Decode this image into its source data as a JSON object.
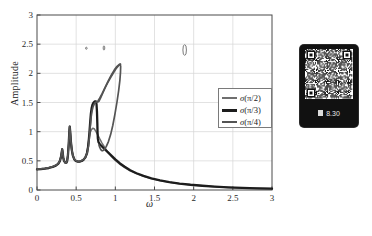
{
  "figure": {
    "ylabel": "Amplitude",
    "xlabel": "ω"
  },
  "legend": {
    "items": [
      {
        "label_sigma": "σ",
        "label_arg": "(π/2)",
        "color": "#6f6f6f",
        "width": 1.6
      },
      {
        "label_sigma": "σ",
        "label_arg": "(π/3)",
        "color": "#1d1d1d",
        "width": 2.4
      },
      {
        "label_sigma": "σ",
        "label_arg": "(π/4)",
        "color": "#545454",
        "width": 1.8
      }
    ]
  },
  "qr_panel": {
    "caption": "8.30"
  },
  "chart_data": {
    "type": "line",
    "title": "",
    "xlabel": "ω",
    "ylabel": "Amplitude",
    "xlim": [
      0,
      3
    ],
    "ylim": [
      0,
      3
    ],
    "xticks": [
      "0",
      "0.5",
      "1",
      "1.5",
      "2",
      "2.5",
      "3"
    ],
    "yticks": [
      "0",
      "0.5",
      "1",
      "1.5",
      "2",
      "2.5",
      "3"
    ],
    "xtick_values": [
      0,
      0.5,
      1,
      1.5,
      2,
      2.5,
      3
    ],
    "ytick_values": [
      0,
      0.5,
      1,
      1.5,
      2,
      2.5,
      3
    ],
    "grid": true,
    "legend_position": "right",
    "series": [
      {
        "name": "σ(π/2)",
        "color": "#6f6f6f",
        "width": 1.5,
        "points": [
          [
            0.0,
            0.355
          ],
          [
            0.05,
            0.36
          ],
          [
            0.1,
            0.368
          ],
          [
            0.15,
            0.38
          ],
          [
            0.2,
            0.398
          ],
          [
            0.24,
            0.42
          ],
          [
            0.27,
            0.45
          ],
          [
            0.29,
            0.495
          ],
          [
            0.305,
            0.56
          ],
          [
            0.315,
            0.64
          ],
          [
            0.322,
            0.7
          ],
          [
            0.328,
            0.64
          ],
          [
            0.335,
            0.56
          ],
          [
            0.345,
            0.5
          ],
          [
            0.36,
            0.47
          ],
          [
            0.375,
            0.47
          ],
          [
            0.385,
            0.5
          ],
          [
            0.395,
            0.6
          ],
          [
            0.405,
            0.79
          ],
          [
            0.412,
            0.98
          ],
          [
            0.418,
            1.09
          ],
          [
            0.424,
            1.0
          ],
          [
            0.432,
            0.84
          ],
          [
            0.444,
            0.69
          ],
          [
            0.458,
            0.59
          ],
          [
            0.475,
            0.53
          ],
          [
            0.495,
            0.5
          ],
          [
            0.52,
            0.49
          ],
          [
            0.545,
            0.49
          ],
          [
            0.57,
            0.5
          ],
          [
            0.595,
            0.52
          ],
          [
            0.615,
            0.555
          ],
          [
            0.632,
            0.61
          ],
          [
            0.645,
            0.7
          ],
          [
            0.655,
            0.8
          ],
          [
            0.665,
            0.9
          ],
          [
            0.678,
            0.98
          ],
          [
            0.695,
            1.035
          ],
          [
            0.712,
            1.058
          ],
          [
            0.73,
            1.05
          ],
          [
            0.75,
            1.01
          ],
          [
            0.772,
            0.955
          ],
          [
            0.8,
            0.88
          ],
          [
            0.83,
            0.805
          ],
          [
            0.865,
            0.73
          ],
          [
            0.905,
            0.65
          ],
          [
            0.95,
            0.575
          ],
          [
            1.0,
            0.505
          ],
          [
            1.06,
            0.44
          ],
          [
            1.12,
            0.385
          ],
          [
            1.19,
            0.33
          ],
          [
            1.27,
            0.28
          ],
          [
            1.36,
            0.236
          ],
          [
            1.46,
            0.196
          ],
          [
            1.57,
            0.162
          ],
          [
            1.69,
            0.133
          ],
          [
            1.82,
            0.108
          ],
          [
            1.96,
            0.088
          ],
          [
            2.11,
            0.071
          ],
          [
            2.27,
            0.057
          ],
          [
            2.44,
            0.045
          ],
          [
            2.62,
            0.036
          ],
          [
            2.81,
            0.028
          ],
          [
            3.0,
            0.022
          ]
        ]
      },
      {
        "name": "σ(π/3)",
        "color": "#1d1d1d",
        "width": 2.3,
        "points": [
          [
            0.0,
            0.352
          ],
          [
            0.05,
            0.357
          ],
          [
            0.1,
            0.365
          ],
          [
            0.15,
            0.377
          ],
          [
            0.2,
            0.395
          ],
          [
            0.24,
            0.418
          ],
          [
            0.27,
            0.448
          ],
          [
            0.29,
            0.492
          ],
          [
            0.305,
            0.558
          ],
          [
            0.315,
            0.638
          ],
          [
            0.322,
            0.698
          ],
          [
            0.328,
            0.638
          ],
          [
            0.335,
            0.558
          ],
          [
            0.345,
            0.498
          ],
          [
            0.36,
            0.468
          ],
          [
            0.375,
            0.468
          ],
          [
            0.385,
            0.498
          ],
          [
            0.395,
            0.598
          ],
          [
            0.405,
            0.788
          ],
          [
            0.412,
            0.978
          ],
          [
            0.418,
            1.088
          ],
          [
            0.424,
            0.998
          ],
          [
            0.432,
            0.838
          ],
          [
            0.444,
            0.688
          ],
          [
            0.458,
            0.588
          ],
          [
            0.475,
            0.528
          ],
          [
            0.495,
            0.498
          ],
          [
            0.52,
            0.488
          ],
          [
            0.545,
            0.488
          ],
          [
            0.57,
            0.498
          ],
          [
            0.595,
            0.52
          ],
          [
            0.618,
            0.56
          ],
          [
            0.638,
            0.63
          ],
          [
            0.652,
            0.74
          ],
          [
            0.663,
            0.88
          ],
          [
            0.672,
            1.03
          ],
          [
            0.68,
            1.18
          ],
          [
            0.688,
            1.31
          ],
          [
            0.697,
            1.4
          ],
          [
            0.708,
            1.46
          ],
          [
            0.722,
            1.5
          ],
          [
            0.738,
            1.52
          ],
          [
            0.752,
            1.52
          ],
          [
            0.76,
            1.47
          ],
          [
            0.766,
            1.33
          ],
          [
            0.77,
            1.15
          ],
          [
            0.773,
            0.99
          ],
          [
            0.777,
            0.88
          ],
          [
            0.785,
            0.82
          ],
          [
            0.8,
            0.79
          ],
          [
            0.82,
            0.76
          ],
          [
            0.845,
            0.725
          ],
          [
            0.875,
            0.685
          ],
          [
            0.91,
            0.64
          ],
          [
            0.95,
            0.588
          ],
          [
            1.0,
            0.525
          ],
          [
            1.06,
            0.455
          ],
          [
            1.12,
            0.398
          ],
          [
            1.19,
            0.34
          ],
          [
            1.27,
            0.288
          ],
          [
            1.36,
            0.242
          ],
          [
            1.46,
            0.201
          ],
          [
            1.57,
            0.166
          ],
          [
            1.69,
            0.136
          ],
          [
            1.82,
            0.111
          ],
          [
            1.96,
            0.09
          ],
          [
            2.11,
            0.073
          ],
          [
            2.27,
            0.058
          ],
          [
            2.44,
            0.046
          ],
          [
            2.62,
            0.037
          ],
          [
            2.81,
            0.029
          ],
          [
            3.0,
            0.023
          ]
        ]
      },
      {
        "name": "σ(π/4)",
        "color": "#545454",
        "width": 1.7,
        "points": [
          [
            0.0,
            0.358
          ],
          [
            0.05,
            0.363
          ],
          [
            0.1,
            0.371
          ],
          [
            0.15,
            0.383
          ],
          [
            0.2,
            0.401
          ],
          [
            0.24,
            0.423
          ],
          [
            0.27,
            0.453
          ],
          [
            0.29,
            0.498
          ],
          [
            0.305,
            0.563
          ],
          [
            0.315,
            0.643
          ],
          [
            0.322,
            0.703
          ],
          [
            0.328,
            0.643
          ],
          [
            0.335,
            0.563
          ],
          [
            0.345,
            0.503
          ],
          [
            0.36,
            0.473
          ],
          [
            0.375,
            0.473
          ],
          [
            0.385,
            0.503
          ],
          [
            0.395,
            0.603
          ],
          [
            0.405,
            0.793
          ],
          [
            0.412,
            0.983
          ],
          [
            0.418,
            1.093
          ],
          [
            0.424,
            1.003
          ],
          [
            0.432,
            0.843
          ],
          [
            0.444,
            0.693
          ],
          [
            0.458,
            0.593
          ],
          [
            0.475,
            0.533
          ],
          [
            0.495,
            0.503
          ],
          [
            0.52,
            0.493
          ],
          [
            0.545,
            0.493
          ],
          [
            0.57,
            0.503
          ],
          [
            0.598,
            0.528
          ],
          [
            0.622,
            0.572
          ],
          [
            0.642,
            0.645
          ],
          [
            0.658,
            0.765
          ],
          [
            0.67,
            0.92
          ],
          [
            0.68,
            1.09
          ],
          [
            0.69,
            1.24
          ],
          [
            0.702,
            1.35
          ],
          [
            0.716,
            1.43
          ],
          [
            0.732,
            1.478
          ],
          [
            0.748,
            1.505
          ],
          [
            0.762,
            1.512
          ],
          [
            0.775,
            1.508
          ],
          [
            0.79,
            1.52
          ],
          [
            0.812,
            1.58
          ],
          [
            0.84,
            1.665
          ],
          [
            0.872,
            1.762
          ],
          [
            0.908,
            1.865
          ],
          [
            0.948,
            1.968
          ],
          [
            0.988,
            2.06
          ],
          [
            1.022,
            2.12
          ],
          [
            1.048,
            2.15
          ],
          [
            1.062,
            2.158
          ],
          [
            1.068,
            2.12
          ],
          [
            1.066,
            2.02
          ],
          [
            1.058,
            1.88
          ],
          [
            1.042,
            1.7
          ],
          [
            1.02,
            1.5
          ],
          [
            0.995,
            1.3
          ],
          [
            0.968,
            1.11
          ],
          [
            0.94,
            0.95
          ],
          [
            0.912,
            0.83
          ],
          [
            0.885,
            0.748
          ],
          [
            0.862,
            0.7
          ],
          [
            0.845,
            0.678
          ],
          [
            0.832,
            0.672
          ],
          [
            0.822,
            0.68
          ],
          [
            0.812,
            0.7
          ],
          [
            0.8,
            0.735
          ],
          [
            0.79,
            0.775
          ]
        ]
      },
      {
        "name": "σ(π/4)-upper-branch",
        "color": "#545454",
        "width": 1.7,
        "points": [
          [
            0.768,
            1.512
          ],
          [
            0.78,
            1.53
          ],
          [
            0.8,
            1.575
          ],
          [
            0.828,
            1.645
          ],
          [
            0.86,
            1.73
          ],
          [
            0.896,
            1.822
          ],
          [
            0.934,
            1.915
          ],
          [
            0.972,
            2.002
          ],
          [
            1.008,
            2.078
          ],
          [
            1.038,
            2.128
          ],
          [
            1.058,
            2.152
          ],
          [
            1.066,
            2.157
          ]
        ]
      }
    ],
    "artifacts": [
      {
        "name": "speck-dot",
        "x": 0.63,
        "y": 2.43,
        "w": 0.012,
        "h": 0.035
      },
      {
        "name": "speck-tick",
        "x": 0.855,
        "y": 2.435,
        "w": 0.008,
        "h": 0.075
      },
      {
        "name": "speck-oval",
        "x": 1.885,
        "y": 2.4,
        "w": 0.045,
        "h": 0.185
      }
    ]
  }
}
